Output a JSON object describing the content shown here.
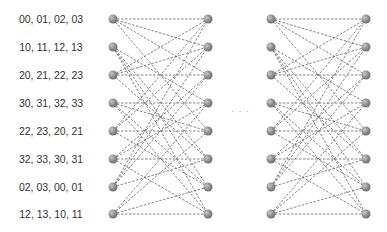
{
  "labels": [
    "00, 01, 02, 03",
    "10, 11, 12, 13",
    "20, 21, 22, 23",
    "30, 31, 32, 33",
    "22, 23, 20, 21",
    "32, 33, 30, 31",
    "02, 03, 00, 01",
    "12, 13, 10, 11"
  ],
  "ellipsis": "· · ·",
  "node_color": "#8a8a8a",
  "edge_color": "#666666",
  "row_y": [
    19,
    47,
    75,
    103,
    131,
    159,
    187,
    214
  ],
  "stages": [
    {
      "left_x": 113,
      "right_x": 208
    },
    {
      "left_x": 271,
      "right_x": 366
    }
  ],
  "edges": [
    [
      0,
      0
    ],
    [
      0,
      1
    ],
    [
      0,
      2
    ],
    [
      0,
      4
    ],
    [
      1,
      3
    ],
    [
      1,
      5
    ],
    [
      1,
      6
    ],
    [
      1,
      7
    ],
    [
      2,
      0
    ],
    [
      2,
      1
    ],
    [
      2,
      2
    ],
    [
      2,
      5
    ],
    [
      3,
      3
    ],
    [
      3,
      4
    ],
    [
      3,
      6
    ],
    [
      3,
      7
    ],
    [
      4,
      0
    ],
    [
      4,
      1
    ],
    [
      4,
      4
    ],
    [
      4,
      6
    ],
    [
      5,
      2
    ],
    [
      5,
      3
    ],
    [
      5,
      5
    ],
    [
      5,
      7
    ],
    [
      6,
      0
    ],
    [
      6,
      1
    ],
    [
      6,
      2
    ],
    [
      6,
      5
    ],
    [
      7,
      3
    ],
    [
      7,
      4
    ],
    [
      7,
      6
    ],
    [
      7,
      7
    ]
  ]
}
